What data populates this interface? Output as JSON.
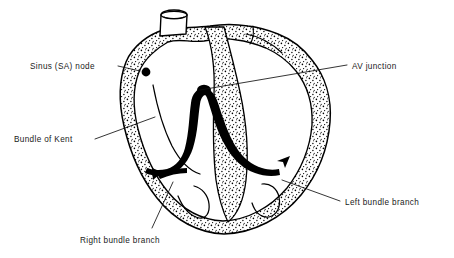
{
  "figure": {
    "background_color": "#ffffff",
    "ink_color": "#000000",
    "text_color": "#1a1a1a"
  },
  "labels": [
    {
      "id": "sinus-sa-node",
      "text": "Sinus (SA) node",
      "text_x": 30,
      "text_y": 69,
      "anchor": "start",
      "leader": "M 118 66 L 140 71",
      "target_structure": "sa-node-dot"
    },
    {
      "id": "av-junction",
      "text": "AV junction",
      "text_x": 352,
      "text_y": 69,
      "anchor": "start",
      "leader": "M 200 90 L 347 65",
      "target_structure": "av-junction-bundle"
    },
    {
      "id": "bundle-of-kent",
      "text": "Bundle of Kent",
      "text_x": 14,
      "text_y": 142,
      "anchor": "start",
      "leader": "M 95 139 L 155 117",
      "target_structure": "accessory-pathway"
    },
    {
      "id": "right-bundle-branch",
      "text": "Right bundle branch",
      "text_x": 80,
      "text_y": 243,
      "anchor": "start",
      "leader": "M 152 228 L 173 182",
      "target_structure": "right-bundle-branch-fiber"
    },
    {
      "id": "left-bundle-branch",
      "text": "Left bundle branch",
      "text_x": 345,
      "text_y": 205,
      "anchor": "start",
      "leader": "M 282 180 L 340 201",
      "target_structure": "left-bundle-branch-fiber"
    }
  ],
  "structures": {
    "sa_node": {
      "name": "sinus node",
      "cx": 146,
      "cy": 72,
      "r": 4.4
    },
    "vessel_stub": {
      "name": "great vessel stub"
    },
    "myocardial_wall": {
      "name": "myocardium",
      "texture": "stipple"
    },
    "conduction_bundle": {
      "name": "His bundle and branches",
      "color": "#000000"
    }
  }
}
